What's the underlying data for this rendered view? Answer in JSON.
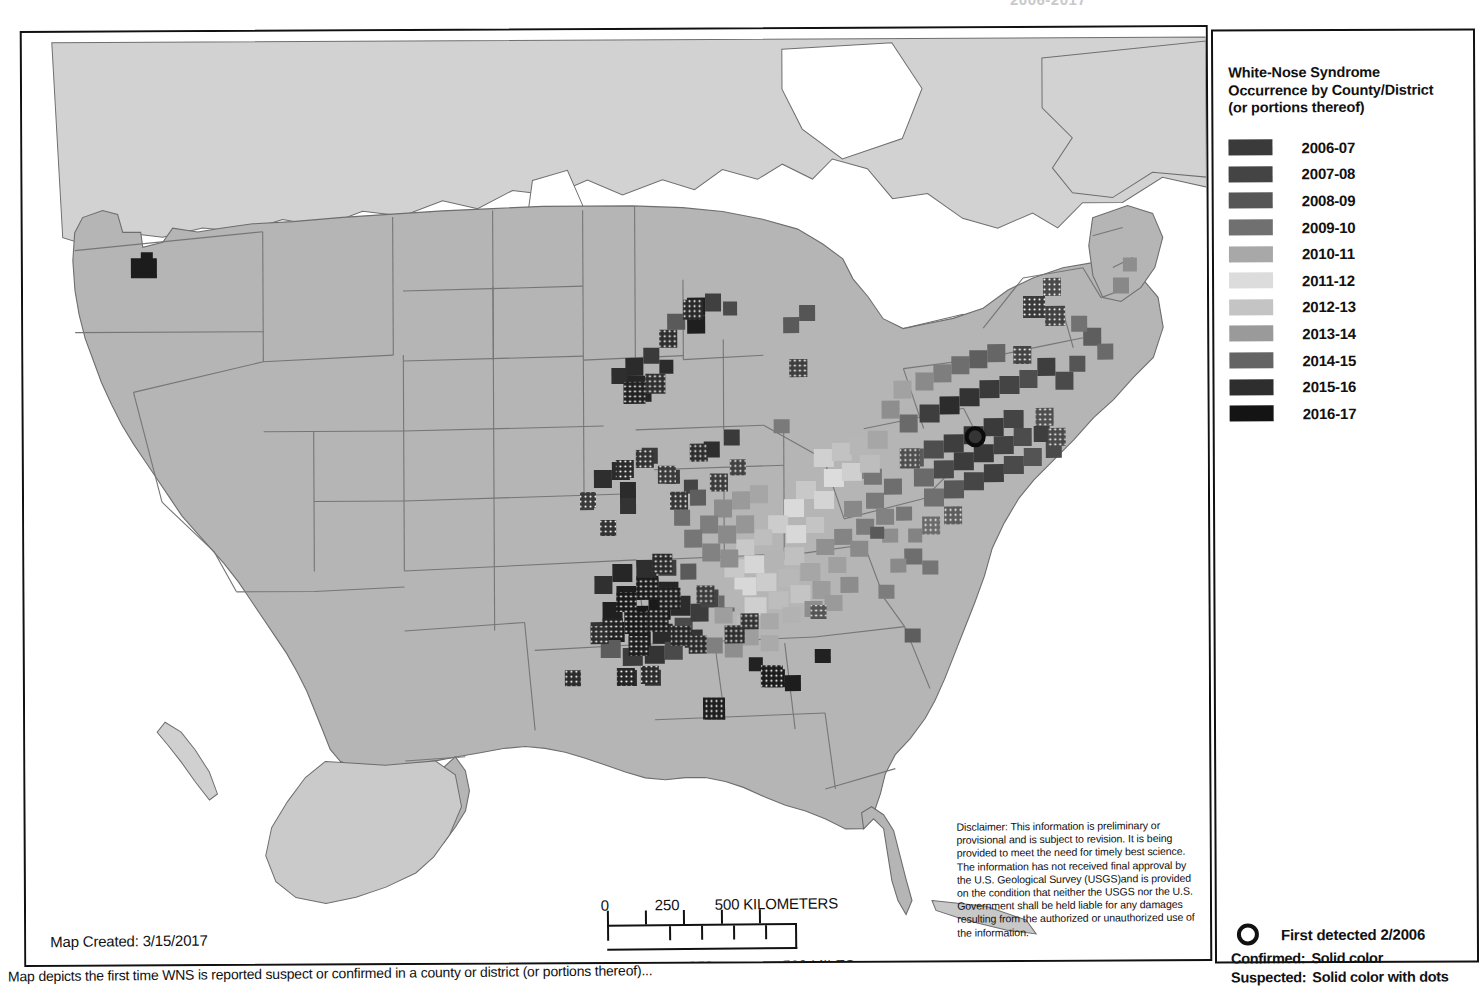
{
  "clipped_header": "2006-2017",
  "legend": {
    "title_lines": [
      "White-Nose Syndrome",
      "Occurrence by County/District",
      "(or portions thereof)"
    ],
    "items": [
      {
        "label": "2006-07",
        "color": "#3a3a3a"
      },
      {
        "label": "2007-08",
        "color": "#444444"
      },
      {
        "label": "2008-09",
        "color": "#565656"
      },
      {
        "label": "2009-10",
        "color": "#707070"
      },
      {
        "label": "2010-11",
        "color": "#a8a8a8"
      },
      {
        "label": "2011-12",
        "color": "#dcdcdc"
      },
      {
        "label": "2012-13",
        "color": "#c4c4c4"
      },
      {
        "label": "2013-14",
        "color": "#9a9a9a"
      },
      {
        "label": "2014-15",
        "color": "#646464"
      },
      {
        "label": "2015-16",
        "color": "#2e2e2e"
      },
      {
        "label": "2016-17",
        "color": "#141414"
      }
    ],
    "key": {
      "first_detected": "First detected 2/2006",
      "confirmed_label": "Confirmed:",
      "confirmed_value": "Solid color",
      "suspected_label": "Suspected:",
      "suspected_value": "Solid color with dots"
    }
  },
  "map_created": "Map Created:  3/15/2017",
  "scalebar": {
    "km_ticks": [
      "0",
      "250",
      "500 KILOMETERS"
    ],
    "mi_ticks": [
      "0",
      "250",
      "500 MILES"
    ]
  },
  "disclaimer": "Disclaimer: This information is preliminary or provisional and is subject to revision. It is being provided to meet the need for timely best science. The information has not received final approval by the U.S. Geological Survey (USGS)and is provided on the condition that neither the USGS nor the U.S. Government shall be held liable for any damages resulting from the authorized or unauthorized use of the information.",
  "caption": "Map depicts the first time WNS is reported suspect or confirmed in a county or district (or portions thereof)...",
  "map": {
    "basemap_fill": "#b5b5b5",
    "basemap_stroke": "#6e6e6e",
    "canada_fill": "#d2d2d2",
    "water_fill": "#ffffff",
    "border_color": "#111111"
  }
}
